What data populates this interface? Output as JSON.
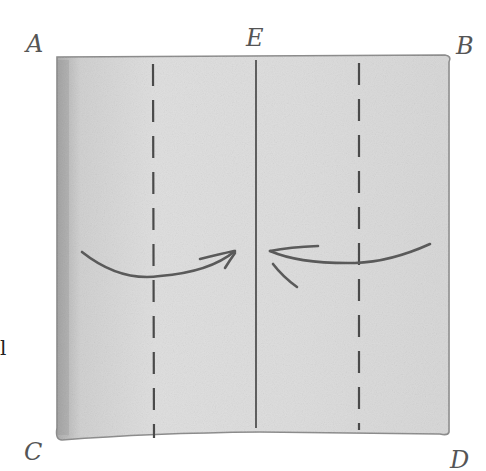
{
  "diagram": {
    "type": "paper-folding-illustration",
    "corner_labels": {
      "top_left": "A",
      "top_center": "E",
      "top_right": "B",
      "bottom_left": "C",
      "bottom_right": "D"
    },
    "edge_fragment": "l",
    "lines": [
      {
        "kind": "dashed",
        "position": "left quarter"
      },
      {
        "kind": "solid",
        "position": "center",
        "label": "E"
      },
      {
        "kind": "dashed",
        "position": "right quarter"
      }
    ],
    "arrows": [
      {
        "from": "left edge",
        "to": "center",
        "direction": "right"
      },
      {
        "from": "right edge",
        "to": "center",
        "direction": "left"
      }
    ],
    "colors": {
      "paper": "#d9d9d9",
      "paper_edge": "#8a8a8a",
      "ink": "#555555",
      "background": "#ffffff"
    }
  }
}
